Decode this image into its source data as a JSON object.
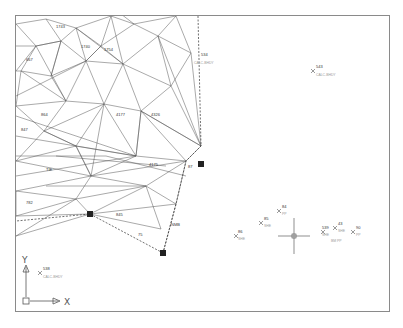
{
  "viewport": {
    "description": "CAD model space drawing of survey point triangulation network",
    "frame_color": "#8a8a8a",
    "background": "#ffffff",
    "line_color": "#555555",
    "dashed_boundary_color": "#333333"
  },
  "ucs_icon": {
    "y_label": "Y",
    "x_label": "X"
  },
  "points": [
    {
      "id": "543",
      "desc": "CALC-BHDY",
      "x": 312,
      "y": 53
    },
    {
      "id": "534",
      "desc": "CALC-BHDY",
      "x": 185,
      "y": 43
    },
    {
      "id": "538",
      "desc": "CALC-BHDY",
      "x": 40,
      "y": 255
    },
    {
      "id": "86",
      "desc": "SHE",
      "x": 232,
      "y": 218
    },
    {
      "id": "85",
      "desc": "SHE",
      "x": 257,
      "y": 205
    },
    {
      "id": "84",
      "desc": "PP",
      "x": 275,
      "y": 193
    },
    {
      "id": "539",
      "desc": "SHE",
      "x": 319,
      "y": 214
    },
    {
      "id": "43",
      "desc": "SHE",
      "x": 331,
      "y": 210
    },
    {
      "id": "90",
      "desc": "PP",
      "x": 345,
      "y": 214
    },
    {
      "id": "4177",
      "desc": "",
      "x": 103,
      "y": 103
    },
    {
      "id": "4326",
      "desc": "",
      "x": 135,
      "y": 102
    },
    {
      "id": "4175",
      "desc": "",
      "x": 135,
      "y": 150
    },
    {
      "id": "845",
      "desc": "",
      "x": 100,
      "y": 200
    },
    {
      "id": "75",
      "desc": "",
      "x": 122,
      "y": 220
    },
    {
      "id": "87",
      "desc": "",
      "x": 175,
      "y": 152
    }
  ],
  "crosshair": {
    "x": 278,
    "y": 220
  },
  "control_markers": [
    {
      "x": 185,
      "y": 148
    },
    {
      "x": 74,
      "y": 198
    },
    {
      "x": 147,
      "y": 237
    }
  ]
}
